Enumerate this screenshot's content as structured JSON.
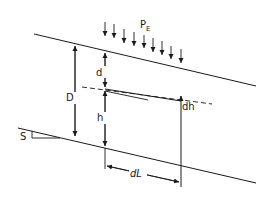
{
  "diagram": {
    "labels": {
      "load": "P",
      "load_sub": "E",
      "total_depth": "D",
      "depth_to_water": "d",
      "head": "h",
      "head_change": "dh",
      "slope": "S",
      "length": "dL"
    },
    "colors": {
      "line": "#1a1a1a",
      "background": "#ffffff"
    }
  }
}
